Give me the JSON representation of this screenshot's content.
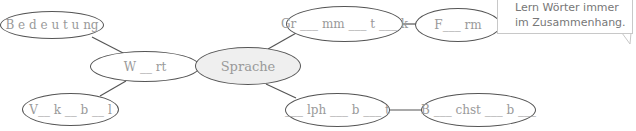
{
  "diagram": {
    "type": "word-web",
    "center": {
      "label": "Sprache"
    },
    "nodes": {
      "bedeutung": {
        "label": "B e d e u t u ng"
      },
      "wort": {
        "label": "W __ rt"
      },
      "vokabel": {
        "label": "V__ k __ b __ l"
      },
      "grammatik": {
        "label": "Gr ___ mm ___ t ___ k"
      },
      "form": {
        "label": "F___ rm"
      },
      "alphabet": {
        "label": "___ lph ___ b ___ t"
      },
      "buchstabe": {
        "label": "B ___ chst ___ b ___"
      }
    },
    "connections": [
      [
        "bedeutung",
        "wort"
      ],
      [
        "wort",
        "center"
      ],
      [
        "wort",
        "vokabel"
      ],
      [
        "center",
        "grammatik"
      ],
      [
        "grammatik",
        "form"
      ],
      [
        "center",
        "alphabet"
      ],
      [
        "alphabet",
        "buchstabe"
      ]
    ],
    "colors": {
      "line": "#555555",
      "text": "#9a9a9a",
      "center_fill": "#efefef"
    }
  },
  "tip_bubble": {
    "lines": [
      "Lern Wörter immer",
      "im Zusammenhang."
    ]
  }
}
